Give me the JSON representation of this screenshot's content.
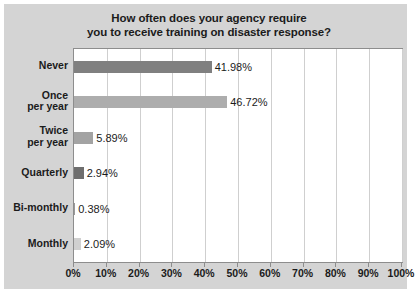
{
  "chart_data": {
    "type": "bar",
    "orientation": "horizontal",
    "title": "How often does your agency require you to receive training on disaster response?",
    "title_lines": [
      "How often does your agency require",
      "you to receive training on disaster response?"
    ],
    "categories": [
      "Never",
      "Once per year",
      "Twice per year",
      "Quarterly",
      "Bi-monthly",
      "Monthly"
    ],
    "category_lines": [
      [
        "Never"
      ],
      [
        "Once",
        "per year"
      ],
      [
        "Twice",
        "per year"
      ],
      [
        "Quarterly"
      ],
      [
        "Bi-monthly"
      ],
      [
        "Monthly"
      ]
    ],
    "values": [
      41.98,
      46.72,
      5.89,
      2.94,
      0.38,
      2.09
    ],
    "value_labels": [
      "41.98%",
      "46.72%",
      "5.89%",
      "2.94%",
      "0.38%",
      "2.09%"
    ],
    "bar_colors": [
      "#808080",
      "#adadad",
      "#a3a3a3",
      "#6e6e6e",
      "#9a9a9a",
      "#d0d0d0"
    ],
    "xlabel": "",
    "ylabel": "",
    "xlim": [
      0,
      100
    ],
    "xtick_labels": [
      "0%",
      "10%",
      "20%",
      "30%",
      "40%",
      "50%",
      "60%",
      "70%",
      "80%",
      "90%",
      "100%"
    ],
    "xtick_values": [
      0,
      10,
      20,
      30,
      40,
      50,
      60,
      70,
      80,
      90,
      100
    ],
    "grid": true,
    "grid_axis": "x",
    "legend": false,
    "plot_background": "#ffffff",
    "figure_background": "#d4d4d4",
    "text_color": "#1b1b1b",
    "grid_color": "#cfcfcf",
    "axis_color": "#8d8d8d"
  }
}
